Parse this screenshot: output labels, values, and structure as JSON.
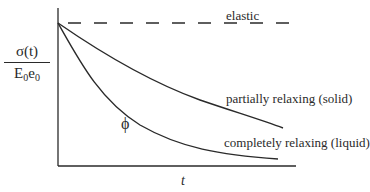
{
  "diagram": {
    "title": "",
    "y_axis_label": {
      "numerator": "σ(t)",
      "denominator_E": "E",
      "denominator_E_sub": "0",
      "denominator_e": "e",
      "denominator_e_sub": "0"
    },
    "x_axis_label": "t",
    "region_symbol": "ϕ",
    "curves": [
      {
        "id": "elastic",
        "label": "elastic",
        "style": "dashed",
        "behavior": "constant"
      },
      {
        "id": "partially-relaxing",
        "label": "partially relaxing (solid)",
        "style": "solid",
        "behavior": "decays to nonzero asymptote"
      },
      {
        "id": "completely-relaxing",
        "label": "completely relaxing (liquid)",
        "style": "solid",
        "behavior": "decays toward zero"
      }
    ],
    "colors": {
      "line": "#2a2a2a",
      "background": "#ffffff"
    }
  }
}
